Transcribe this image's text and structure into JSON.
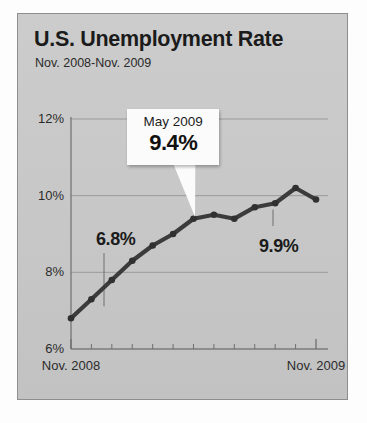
{
  "card": {
    "title": "U.S. Unemployment Rate",
    "subtitle": "Nov. 2008-Nov. 2009"
  },
  "callout": {
    "month_label": "May 2009",
    "value_label": "9.4%",
    "target_index": 6
  },
  "annotations": [
    {
      "name": "start-value-annotation",
      "label": "6.8%",
      "x": 78,
      "y": 215
    },
    {
      "name": "end-value-annotation",
      "label": "9.9%",
      "x": 241,
      "y": 222
    }
  ],
  "colors": {
    "card_background": "#c9c9c9",
    "card_border": "#8e8e8e",
    "line": "#3b3b3b",
    "marker": "#303030",
    "grid": "#9a9a9a",
    "axis": "#6f6f6f",
    "text": "#1b1b1b",
    "callout_background": "#fbfbfb"
  },
  "chart_data": {
    "type": "line",
    "title": "U.S. Unemployment Rate",
    "subtitle": "Nov. 2008-Nov. 2009",
    "xlabel": "",
    "ylabel": "",
    "ylim": [
      6,
      12
    ],
    "yticks": [
      6,
      8,
      10,
      12
    ],
    "ytick_labels": [
      "6%",
      "8%",
      "10%",
      "12%"
    ],
    "grid": true,
    "legend": false,
    "xtick_labels": [
      "Nov. 2008",
      "Nov. 2009"
    ],
    "categories": [
      "Nov. 2008",
      "Dec. 2008",
      "Jan. 2009",
      "Feb. 2009",
      "Mar. 2009",
      "Apr. 2009",
      "May 2009",
      "Jun. 2009",
      "Jul. 2009",
      "Aug. 2009",
      "Sep. 2009",
      "Oct. 2009",
      "Nov. 2009"
    ],
    "values": [
      6.8,
      7.3,
      7.8,
      8.3,
      8.7,
      9.0,
      9.4,
      9.5,
      9.4,
      9.7,
      9.8,
      10.2,
      9.9
    ],
    "series": [
      {
        "name": "Unemployment rate",
        "values": [
          6.8,
          7.3,
          7.8,
          8.3,
          8.7,
          9.0,
          9.4,
          9.5,
          9.4,
          9.7,
          9.8,
          10.2,
          9.9
        ]
      }
    ],
    "annotations": [
      {
        "label": "6.8%",
        "category": "Nov. 2008",
        "value": 6.8
      },
      {
        "label": "9.4%",
        "category": "May 2009",
        "value": 9.4
      },
      {
        "label": "9.9%",
        "category": "Nov. 2009",
        "value": 9.9
      }
    ]
  }
}
